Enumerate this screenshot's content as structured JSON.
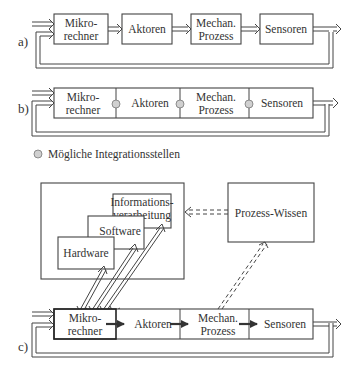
{
  "diagram": {
    "a": {
      "label": "a)",
      "blocks": [
        {
          "line1": "Mikro-",
          "line2": "rechner"
        },
        {
          "line1": "Aktoren",
          "line2": ""
        },
        {
          "line1": "Mechan.",
          "line2": "Prozess"
        },
        {
          "line1": "Sensoren",
          "line2": ""
        }
      ]
    },
    "b": {
      "label": "b)",
      "blocks": [
        {
          "line1": "Mikro-",
          "line2": "rechner"
        },
        {
          "line1": "Aktoren",
          "line2": ""
        },
        {
          "line1": "Mechan.",
          "line2": "Prozess"
        },
        {
          "line1": "Sensoren",
          "line2": ""
        }
      ],
      "legend": "Mögliche Integrationsstellen",
      "marker_color": "#d0d0d0"
    },
    "c": {
      "label": "c)",
      "blocks": [
        {
          "line1": "Mikro-",
          "line2": "rechner"
        },
        {
          "line1": "Aktoren",
          "line2": ""
        },
        {
          "line1": "Mechan.",
          "line2": "Prozess"
        },
        {
          "line1": "Sensoren",
          "line2": ""
        }
      ],
      "layers": {
        "hardware": "Hardware",
        "software": "Software",
        "info_line1": "Informations-",
        "info_line2": "verarbeitung"
      },
      "knowledge": "Prozess-Wissen"
    }
  }
}
